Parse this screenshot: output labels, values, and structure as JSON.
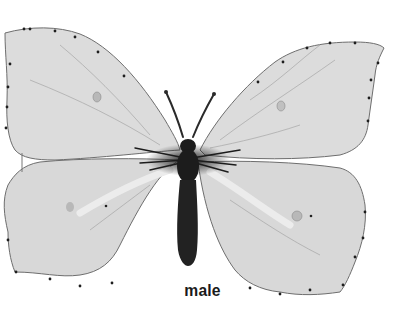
{
  "figure": {
    "caption": "male",
    "colors": {
      "background": "#ffffff",
      "wing_fill": "#dcdcdc",
      "wing_edge": "#6e6e6e",
      "edge_dots": "#1e1e1e",
      "body": "#1c1c1c",
      "wing_highlight": "#ececec",
      "wing_spot": "#b8b8b8"
    }
  }
}
